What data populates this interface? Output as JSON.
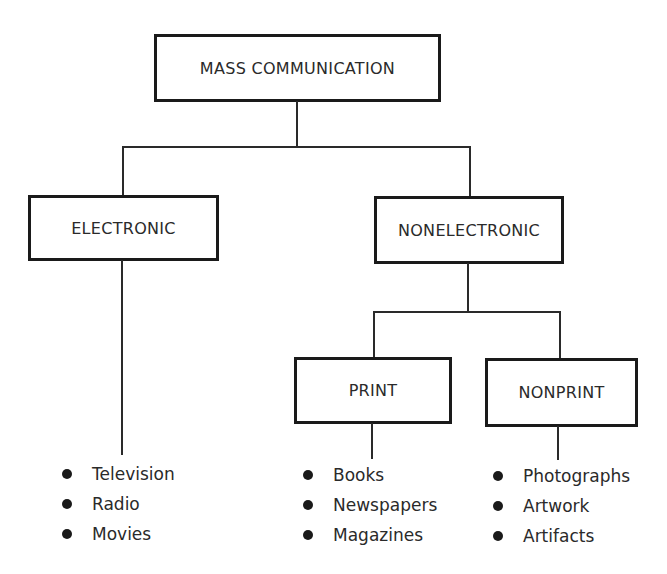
{
  "diagram": {
    "root": {
      "label": "MASS COMMUNICATION"
    },
    "level1": [
      {
        "label": "ELECTRONIC",
        "items": [
          "Television",
          "Radio",
          "Movies"
        ]
      },
      {
        "label": "NONELECTRONIC"
      }
    ],
    "level2": [
      {
        "label": "PRINT",
        "items": [
          "Books",
          "Newspapers",
          "Magazines"
        ]
      },
      {
        "label": "NONPRINT",
        "items": [
          "Photographs",
          "Artwork",
          "Artifacts"
        ]
      }
    ]
  }
}
